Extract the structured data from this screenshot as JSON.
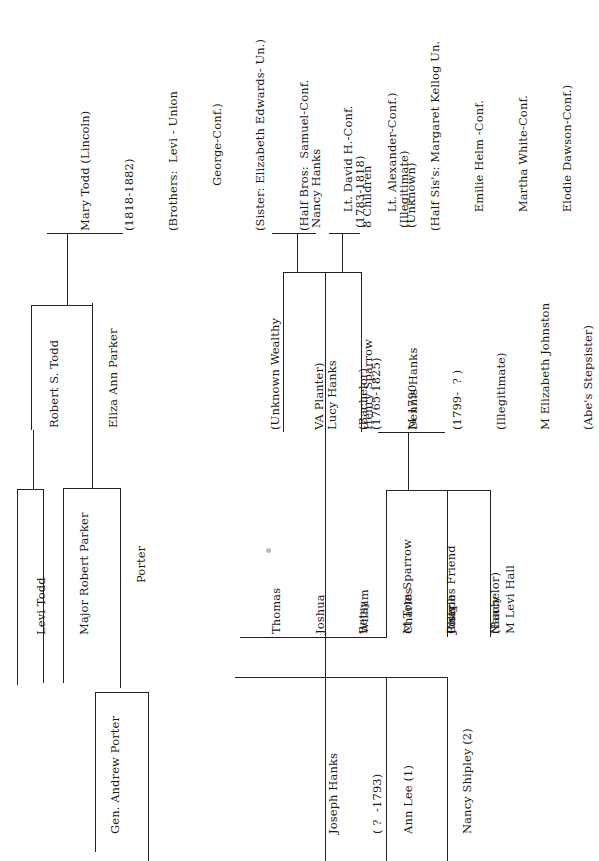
{
  "orientation": "rotated 90 degrees counter-clockwise",
  "todd_side": {
    "mary_todd": {
      "lines": [
        "Mary Todd (Lincoln)",
        "(1818-1882)",
        "(Brothers:  Levi - Union",
        "            George-Conf.)",
        "(Sister: Elizabeth Edwards- Un.)",
        "(Half Bros:  Samuel-Conf.",
        "     Lt. David H.-Conf.",
        "     Lt. Alexander-Conf.)",
        "(Half Sis's: Margaret Kellog Un.",
        "     Emilie Helm -Conf.",
        "     Martha White-Conf.",
        "     Elodie Dawson-Conf.)"
      ]
    },
    "parents": {
      "father": "Robert S. Todd",
      "mother": "Eliza Ann Parker"
    },
    "grandparents": {
      "paternal": "Levi Todd",
      "maternal_grandfather": "Major Robert Parker",
      "maternal_grandmother": "Porter"
    },
    "great_grandparents": {
      "porter_father": "Gen. Andrew Porter"
    }
  },
  "hanks_side": {
    "nancy_hanks": {
      "lines": [
        "Nancy Hanks",
        "(1783-1818)",
        "(Illegitimate)"
      ]
    },
    "siblings": {
      "lines": [
        "8 Children",
        "(Unknown)"
      ]
    },
    "father_unknown": {
      "lines": [
        "(Unknown Wealthy",
        "VA Planter)",
        "(Bachelor)"
      ]
    },
    "lucy_hanks": {
      "lines": [
        "Lucy Hanks",
        "(1765-1825)"
      ]
    },
    "henry_sparrow": {
      "lines": [
        "Henry Sparrow",
        "M 1790"
      ]
    },
    "dennis_hanks": {
      "lines": [
        "Dennis Hanks",
        "(1799-  ? )",
        "(Illegitimate)",
        "M Elizabeth Johnston",
        "(Abe's Stepsister)"
      ]
    },
    "sons": {
      "lines": [
        "Thomas",
        "Joshua",
        "William",
        "Charles",
        "Joseph"
      ]
    },
    "daughters": {
      "lines": [
        "Betsy",
        "M Tom Sparrow",
        "Polly",
        "Nancy"
      ]
    },
    "charles_friend": {
      "lines": [
        "Charles Friend",
        "(Bachelor)"
      ]
    },
    "levi_hall": {
      "lines": [
        "M Levi Hall"
      ]
    },
    "joseph_hanks": {
      "lines": [
        "Joseph Hanks",
        "( ?  -1793)"
      ]
    },
    "ann_lee": {
      "lines": [
        "Ann Lee (1)"
      ]
    },
    "nancy_shipley": {
      "lines": [
        "Nancy Shipley (2)"
      ]
    }
  },
  "colors": {
    "background": "#ffffff",
    "ink": "#222222"
  }
}
